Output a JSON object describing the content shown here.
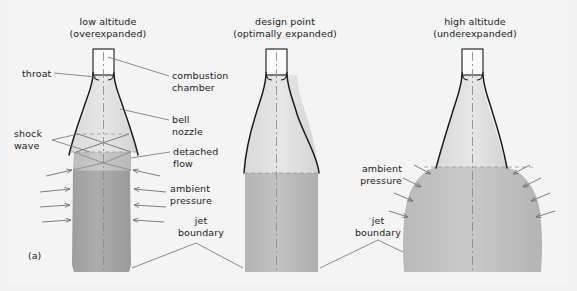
{
  "figure": {
    "label": "(a)",
    "background": "#f4f4f4",
    "outline_color": "#1a1a1a",
    "plume_fill_light": "#d8d8d8",
    "plume_fill_dark": "#a8a8a8",
    "leader_color": "#6b6b6b"
  },
  "panels": [
    {
      "id": "low-altitude",
      "title_line1": "low altitude",
      "title_line2": "(overexpanded)",
      "center_x": 108
    },
    {
      "id": "design-point",
      "title_line1": "design point",
      "title_line2": "(optimally expanded)",
      "center_x": 285
    },
    {
      "id": "high-altitude",
      "title_line1": "high altitude",
      "title_line2": "(underexpanded)",
      "center_x": 475
    }
  ],
  "annotations": {
    "throat": "throat",
    "combustion_chamber_l1": "combustion",
    "combustion_chamber_l2": "chamber",
    "bell_nozzle_l1": "bell",
    "bell_nozzle_l2": "nozzle",
    "shock_wave_l1": "shock",
    "shock_wave_l2": "wave",
    "detached_flow_l1": "detached",
    "detached_flow_l2": "flow",
    "ambient_pressure_left_l1": "ambient",
    "ambient_pressure_left_l2": "pressure",
    "ambient_pressure_right_l1": "ambient",
    "ambient_pressure_right_l2": "pressure",
    "jet_boundary_left_l1": "jet",
    "jet_boundary_left_l2": "boundary",
    "jet_boundary_mid_l1": "jet",
    "jet_boundary_mid_l2": "boundary"
  }
}
